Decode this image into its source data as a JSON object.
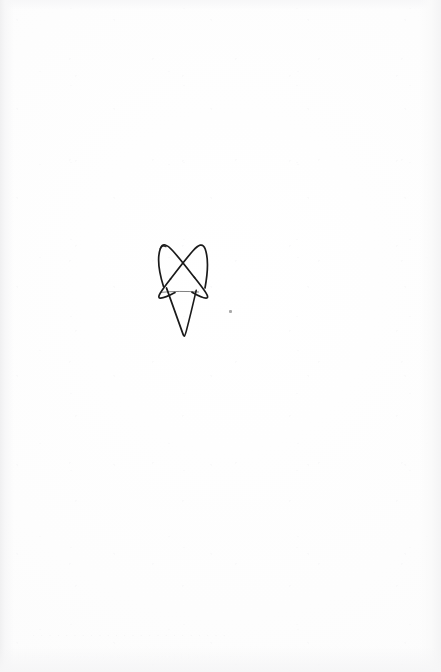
{
  "page": {
    "width": 441,
    "height": 672,
    "background_color": "#fdfdfd",
    "medium": "scanned paper"
  },
  "drawing": {
    "label": "hand-drawn star glyph",
    "ink_color": "#1a1a1a",
    "stroke_width": 1.6,
    "bounds": {
      "x": 157,
      "y": 243,
      "width": 52,
      "height": 93
    },
    "description": "continuous single-stroke unicursal star: two upper peaks, crossed diagonals, faint horizontal crossbar, long narrow descending tail"
  },
  "marks": {
    "speck": {
      "label": "stray ink speck",
      "color": "#9a9a9a",
      "x": 230,
      "y": 311
    }
  },
  "artifacts": {
    "ghost_text_1": "· · · · · · · · · · · · · · · · · · · · · · · ·",
    "ghost_text_2": "· · · · · · · · · · · · · · · · · · · · · · · · · · · · · · · ·"
  }
}
